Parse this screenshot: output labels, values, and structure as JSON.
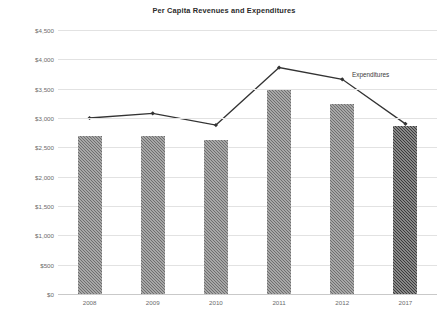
{
  "chart_data": {
    "type": "bar",
    "title": "Per Capita Revenues and Expenditures",
    "xlabel": "",
    "ylabel": "",
    "categories": [
      "2008",
      "2009",
      "2010",
      "2011",
      "2012",
      "2017"
    ],
    "ylim": [
      0,
      4500
    ],
    "ytick_values": [
      0,
      500,
      1000,
      1500,
      2000,
      2500,
      3000,
      3500,
      4000,
      4500
    ],
    "ytick_labels": [
      "$0",
      "$500",
      "$1,000",
      "$1,500",
      "$2,000",
      "$2,500",
      "$3,000",
      "$3,500",
      "$4,000",
      "$4,500"
    ],
    "grid": true,
    "legend_position": "inline-right",
    "series": [
      {
        "name": "Revenues",
        "type": "bar",
        "color": "#6e6e6e",
        "last_bar_color": "#3b3b3b",
        "values": [
          2700,
          2700,
          2630,
          3480,
          3240,
          2870
        ]
      },
      {
        "name": "Expenditures",
        "type": "line",
        "color": "#333333",
        "marker": "diamond",
        "values": [
          3000,
          3080,
          2880,
          3860,
          3660,
          2900
        ]
      }
    ],
    "annotations": [
      {
        "text": "Expenditures",
        "x": 352,
        "y": 71
      }
    ]
  }
}
